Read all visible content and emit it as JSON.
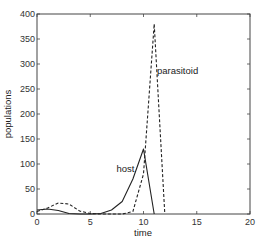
{
  "chart_data": {
    "type": "line",
    "title": "",
    "xlabel": "time",
    "ylabel": "populations",
    "xlim": [
      0,
      20
    ],
    "ylim": [
      0,
      400
    ],
    "xticks": [
      0,
      5,
      10,
      15,
      20
    ],
    "yticks": [
      0,
      50,
      100,
      150,
      200,
      250,
      300,
      350,
      400
    ],
    "grid": false,
    "legend": null,
    "annotations": [
      {
        "text": "host",
        "x": 8.3,
        "y": 85
      },
      {
        "text": "parasitoid",
        "x": 13.2,
        "y": 280
      }
    ],
    "series": [
      {
        "name": "host",
        "style": "solid",
        "x": [
          0,
          1,
          2,
          3,
          4,
          5,
          6,
          7,
          8,
          9,
          10,
          11
        ],
        "y": [
          8,
          10,
          7,
          1,
          0,
          0,
          1,
          8,
          25,
          70,
          130,
          0
        ]
      },
      {
        "name": "parasitoid",
        "style": "dashed",
        "x": [
          0,
          1,
          2,
          3,
          4,
          5,
          6,
          7,
          8,
          9,
          10,
          11,
          12
        ],
        "y": [
          5,
          12,
          22,
          20,
          6,
          1,
          0,
          0,
          0,
          5,
          80,
          380,
          0
        ]
      }
    ]
  }
}
